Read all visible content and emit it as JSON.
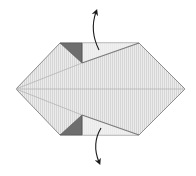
{
  "diagram": {
    "type": "origami-fold-step",
    "colors": {
      "paper": "#e6e6e6",
      "paper_stripe": "#d2d2d2",
      "flap_light": "#f0f0f0",
      "dark_triangle": "#6e6e6e",
      "edge": "#8c8c8c",
      "crease": "#b4b4b4",
      "arrow": "#1a1a1a",
      "background": "#ffffff"
    },
    "arrows": [
      {
        "name": "unfold-up-arrow",
        "direction": "up"
      },
      {
        "name": "unfold-down-arrow",
        "direction": "down"
      }
    ]
  }
}
